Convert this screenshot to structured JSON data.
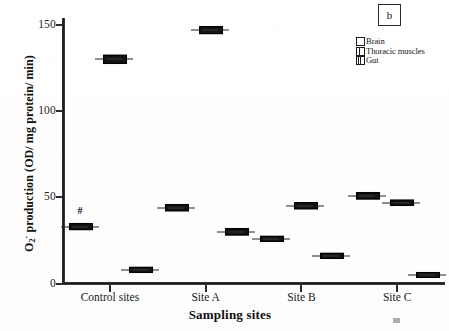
{
  "figure": {
    "panel_label": "b",
    "significance_marker": "#"
  },
  "legend": {
    "position": "top-right",
    "entries": [
      {
        "label": "Brain",
        "swatch": "empty-square"
      },
      {
        "label": "Thoracic muscles",
        "swatch": "split-square"
      },
      {
        "label": "Gut",
        "swatch": "hatched-square"
      }
    ]
  },
  "chart_data": {
    "type": "bar",
    "title": "",
    "subtitle": "",
    "panel": "b",
    "xlabel": "Sampling sites",
    "ylabel": "O2- production (OD/ mg protein/ min)",
    "categories": [
      "Control sites",
      "Site A",
      "Site B",
      "Site C"
    ],
    "series": [
      {
        "name": "Brain",
        "values": [
          33,
          44,
          26,
          51
        ]
      },
      {
        "name": "Thoracic muscles",
        "values": [
          130,
          147,
          45,
          47
        ]
      },
      {
        "name": "Gut",
        "values": [
          8,
          30,
          16,
          5
        ]
      }
    ],
    "error_bars": {
      "note": "narrow horizontal box markers with whiskers",
      "Brain": [
        1.6,
        1.5,
        1.2,
        1.4
      ],
      "Thoracic muscles": [
        1.8,
        1.6,
        1.5,
        1.3
      ],
      "Gut": [
        1.2,
        1.4,
        1.2,
        1.1
      ]
    },
    "annotations": [
      {
        "text": "#",
        "category": "Control sites",
        "series": "Brain",
        "value": 33
      }
    ],
    "ylim": [
      0,
      157
    ],
    "yticks": [
      0,
      50,
      100,
      150
    ],
    "ytick_labels": [
      "0",
      "50",
      "100",
      "150"
    ],
    "grid": false,
    "legend_position": "top-right"
  },
  "axis": {
    "y_title_main": "O",
    "y_title_sub": "2",
    "y_title_sup": "-",
    "y_title_rest": " production (OD/ mg protein/ min)",
    "x_title": "Sampling sites"
  }
}
